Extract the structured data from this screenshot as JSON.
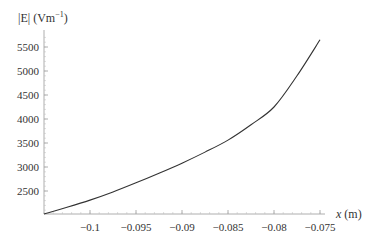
{
  "chart_data": {
    "type": "line",
    "title": "",
    "xlabel": "x (m)",
    "ylabel": "|E| (Vm^-1)",
    "ylabel_parts": {
      "main": "|E| (Vm",
      "sup": "−1",
      "close": ")"
    },
    "xlim": [
      -0.105,
      -0.075
    ],
    "ylim": [
      2020,
      5700
    ],
    "grid": false,
    "legend": null,
    "x_ticks": [
      -0.1,
      -0.095,
      -0.09,
      -0.085,
      -0.08,
      -0.075
    ],
    "x_tick_labels": [
      "−0.1",
      "−0.095",
      "−0.09",
      "−0.085",
      "−0.08",
      "−0.075"
    ],
    "y_ticks": [
      2500,
      3000,
      3500,
      4000,
      4500,
      5000,
      5500
    ],
    "y_tick_labels": [
      "2500",
      "3000",
      "3500",
      "4000",
      "4500",
      "5000",
      "5500"
    ],
    "series": [
      {
        "name": "|E|",
        "color": "#333333",
        "x": [
          -0.105,
          -0.1025,
          -0.1,
          -0.0975,
          -0.095,
          -0.0925,
          -0.09,
          -0.0875,
          -0.085,
          -0.0825,
          -0.08,
          -0.0775,
          -0.075
        ],
        "y": [
          2020,
          2160,
          2310,
          2480,
          2670,
          2870,
          3080,
          3310,
          3560,
          3880,
          4250,
          4900,
          5650
        ]
      }
    ]
  }
}
